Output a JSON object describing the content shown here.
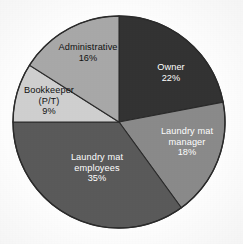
{
  "chart_data": {
    "type": "pie",
    "title": "",
    "xlabel": "",
    "ylabel": "",
    "legend": "none",
    "grid": false,
    "units": "percent",
    "start_angle_deg": 0,
    "direction": "clockwise",
    "categories": [
      "Owner",
      "Laundry mat manager",
      "Laundry mat employees",
      "Bookkeeper (P/T)",
      "Administrative"
    ],
    "values": [
      22,
      18,
      35,
      9,
      16
    ],
    "slices": [
      {
        "label_line1": "Owner",
        "label_line2": "",
        "value_label": "22%",
        "value": 22,
        "color": "#333333",
        "text_color": "#ffffff"
      },
      {
        "label_line1": "Laundry mat",
        "label_line2": "manager",
        "value_label": "18%",
        "value": 18,
        "color": "#8a8a8a",
        "text_color": "#ffffff"
      },
      {
        "label_line1": "Laundry mat",
        "label_line2": "employees",
        "value_label": "35%",
        "value": 35,
        "color": "#5a5a5a",
        "text_color": "#ffffff"
      },
      {
        "label_line1": "Bookkeeper",
        "label_line2": "(P/T)",
        "value_label": "9%",
        "value": 9,
        "color": "#cfcfcf",
        "text_color": "#111111"
      },
      {
        "label_line1": "Administrative",
        "label_line2": "",
        "value_label": "16%",
        "value": 16,
        "color": "#a8a8a8",
        "text_color": "#111111"
      }
    ],
    "geometry": {
      "center_x": 119,
      "center_y": 122,
      "radius": 106
    },
    "colors": {
      "outline": "#2b2b2b",
      "background": "#fdfdfd"
    }
  }
}
